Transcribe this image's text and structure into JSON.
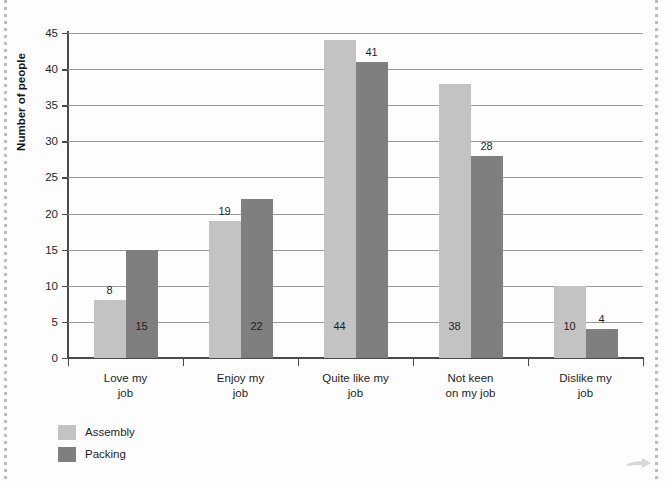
{
  "chart_data": {
    "type": "bar",
    "title": "",
    "xlabel": "",
    "ylabel": "Number of people",
    "ylim": [
      0,
      45
    ],
    "ytick_step": 5,
    "yticks": [
      0,
      5,
      10,
      15,
      20,
      25,
      30,
      35,
      40,
      45
    ],
    "grid": true,
    "legend_position": "bottom-left",
    "categories": [
      "Love my\njob",
      "Enjoy my\njob",
      "Quite like my\njob",
      "Not keen\non my job",
      "Dislike my\njob"
    ],
    "category_lines": [
      [
        "Love my",
        "job"
      ],
      [
        "Enjoy my",
        "job"
      ],
      [
        "Quite like my",
        "job"
      ],
      [
        "Not keen",
        "on my job"
      ],
      [
        "Dislike my",
        "job"
      ]
    ],
    "series": [
      {
        "name": "Assembly",
        "color": "#c3c3c3",
        "values": [
          8,
          19,
          44,
          38,
          10
        ]
      },
      {
        "name": "Packing",
        "color": "#7f7f7f",
        "values": [
          15,
          22,
          41,
          28,
          4
        ]
      }
    ]
  },
  "legend": {
    "items": [
      {
        "label": "Assembly",
        "color": "#c3c3c3"
      },
      {
        "label": "Packing",
        "color": "#7f7f7f"
      }
    ]
  },
  "axis": {
    "y_title": "Number of people",
    "y_tick_labels": [
      "45",
      "40",
      "35",
      "30",
      "25",
      "20",
      "15",
      "10",
      "5",
      "0"
    ]
  },
  "bar_labels": {
    "g0": {
      "assembly": "8",
      "packing": "15"
    },
    "g1": {
      "assembly": "19",
      "packing": "22"
    },
    "g2": {
      "assembly": "44",
      "packing": "41"
    },
    "g3": {
      "assembly": "38",
      "packing": "28"
    },
    "g4": {
      "assembly": "10",
      "packing": "4"
    }
  },
  "decor": {
    "corner_arrow_icon": "arrow-right-icon"
  }
}
